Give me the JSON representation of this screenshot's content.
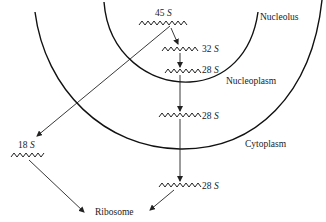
{
  "regions": {
    "nucleolus": "Nucleolus",
    "nucleoplasm": "Nucleoplasm",
    "cytoplasm": "Cytoplasm",
    "ribosome": "Ribosome"
  },
  "molecules": [
    {
      "id": "rna-45s",
      "value": "45",
      "unit": "S",
      "location": "Nucleolus"
    },
    {
      "id": "rna-32s",
      "value": "32",
      "unit": "S",
      "location": "Nucleolus"
    },
    {
      "id": "rna-28s-nucleolus",
      "value": "28",
      "unit": "S",
      "location": "Nucleolus"
    },
    {
      "id": "rna-28s-nucleoplasm",
      "value": "28",
      "unit": "S",
      "location": "Nucleoplasm"
    },
    {
      "id": "rna-28s-cytoplasm",
      "value": "28",
      "unit": "S",
      "location": "Cytoplasm"
    },
    {
      "id": "rna-18s",
      "value": "18",
      "unit": "S",
      "location": "Cytoplasm"
    }
  ],
  "edges": [
    {
      "from": "45 S",
      "to": "32 S"
    },
    {
      "from": "32 S",
      "to": "28 S (nucleolus)"
    },
    {
      "from": "28 S (nucleolus)",
      "to": "28 S (nucleoplasm)"
    },
    {
      "from": "28 S (nucleoplasm)",
      "to": "28 S (cytoplasm)"
    },
    {
      "from": "45 S",
      "to": "18 S"
    },
    {
      "from": "18 S",
      "to": "Ribosome"
    },
    {
      "from": "28 S (cytoplasm)",
      "to": "Ribosome"
    }
  ]
}
